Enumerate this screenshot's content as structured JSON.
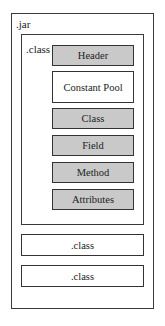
{
  "diagram": {
    "jar_label": ".jar",
    "class_label": ".class",
    "segments": [
      {
        "label": "Header",
        "fill": "#c9c9c9"
      },
      {
        "label": "Constant Pool",
        "fill": "#ffffff"
      },
      {
        "label": "Class",
        "fill": "#c9c9c9"
      },
      {
        "label": "Field",
        "fill": "#c9c9c9"
      },
      {
        "label": "Method",
        "fill": "#c9c9c9"
      },
      {
        "label": "Attributes",
        "fill": "#c9c9c9"
      }
    ],
    "other_classes": [
      {
        "label": ".class"
      },
      {
        "label": ".class"
      }
    ]
  }
}
